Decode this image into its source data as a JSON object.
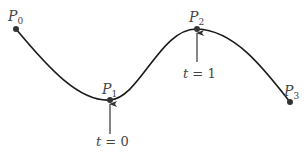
{
  "diagram": {
    "type": "spline-curve",
    "colors": {
      "curve": "#1a1a1a",
      "point": "#333333",
      "label": "#444444",
      "arrow": "#333333"
    },
    "points": [
      {
        "name": "P",
        "sub": "0",
        "x": 16,
        "y": 29
      },
      {
        "name": "P",
        "sub": "1",
        "x": 110,
        "y": 100
      },
      {
        "name": "P",
        "sub": "2",
        "x": 197,
        "y": 29
      },
      {
        "name": "P",
        "sub": "3",
        "x": 290,
        "y": 102
      }
    ],
    "annotations": [
      {
        "text_var": "t",
        "text_rest": " = 0",
        "target": "P1"
      },
      {
        "text_var": "t",
        "text_rest": " = 1",
        "target": "P2"
      }
    ]
  }
}
